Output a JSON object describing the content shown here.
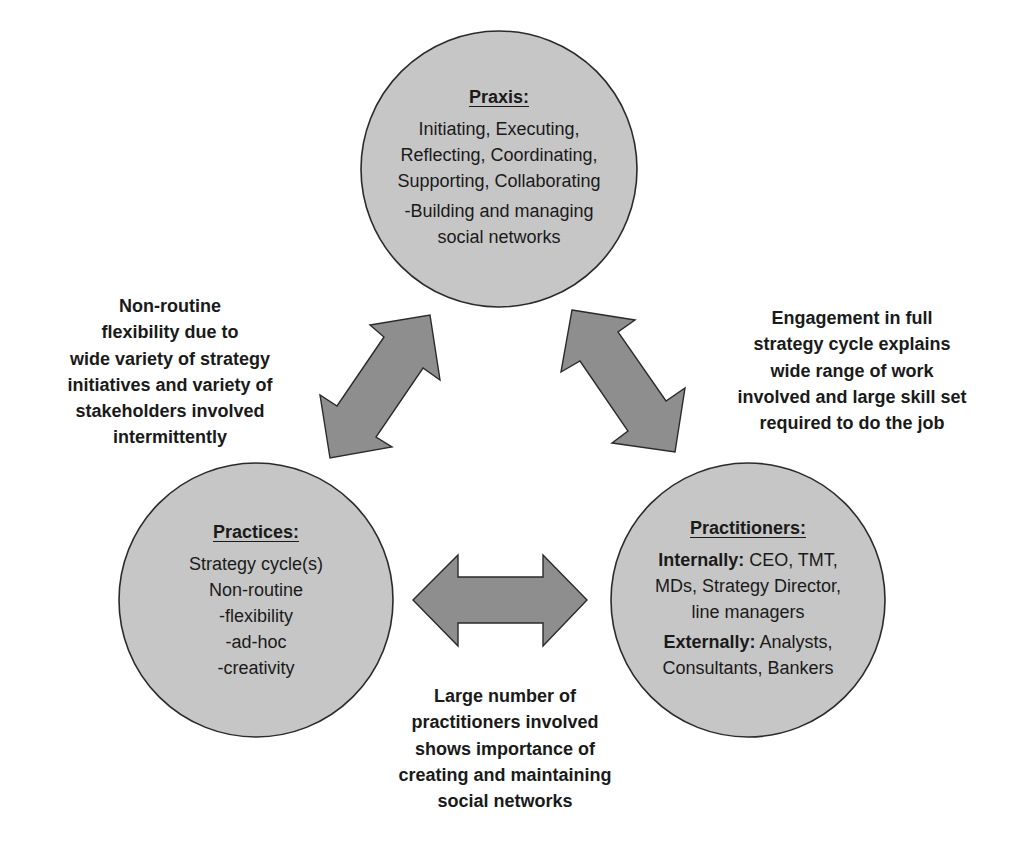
{
  "diagram": {
    "colors": {
      "circle_fill": "#c6c6c6",
      "arrow_fill": "#8e8e8e",
      "outline": "#2a2a2a",
      "text": "#1a1a1a",
      "background": "#ffffff"
    },
    "nodes": {
      "praxis": {
        "heading": "Praxis:",
        "lines": [
          "Initiating, Executing,",
          "Reflecting, Coordinating,",
          "Supporting, Collaborating",
          "-Building and managing",
          "social networks"
        ]
      },
      "practices": {
        "heading": "Practices:",
        "lines": [
          "Strategy cycle(s)",
          "Non-routine",
          "-flexibility",
          "-ad-hoc",
          "-creativity"
        ]
      },
      "practitioners": {
        "heading": "Practitioners:",
        "internally_label": "Internally:",
        "internally_line1": " CEO, TMT,",
        "internally_line2": "MDs, Strategy Director,",
        "internally_line3": "line managers",
        "externally_label": "Externally:",
        "externally_line1": " Analysts,",
        "externally_line2": "Consultants, Bankers"
      }
    },
    "connectors": [
      {
        "from": "praxis",
        "to": "practices",
        "type": "double-arrow"
      },
      {
        "from": "praxis",
        "to": "practitioners",
        "type": "double-arrow"
      },
      {
        "from": "practices",
        "to": "practitioners",
        "type": "double-arrow"
      }
    ],
    "notes": {
      "praxis_practices": [
        "Non-routine",
        "flexibility due to",
        "wide variety of strategy",
        "initiatives and variety of",
        "stakeholders involved",
        "intermittently"
      ],
      "praxis_practitioners": [
        "Engagement in full",
        "strategy cycle explains",
        "wide range of work",
        "involved and large skill set",
        "required to do the job"
      ],
      "practices_practitioners": [
        "Large number of",
        "practitioners involved",
        "shows importance of",
        "creating and maintaining",
        "social networks"
      ]
    }
  }
}
